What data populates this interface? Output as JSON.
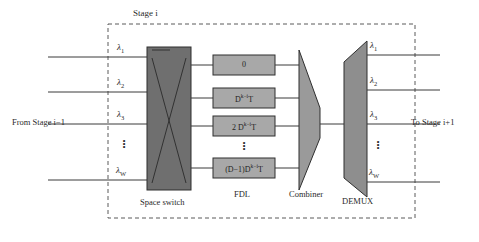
{
  "figure": {
    "type": "block-diagram",
    "title": "Stage i",
    "background": "#ffffff"
  },
  "colors": {
    "space_switch_fill": "#6f6f6f",
    "fdl_fill": "#a8a8a8",
    "combiner_fill": "#9a9a9a",
    "demux_fill": "#8e8e8e",
    "line": "#3a3a3a",
    "dashed_border": "#5a5a5a",
    "text": "#2a2a2a"
  },
  "labels": {
    "stage_title": "Stage i",
    "input_source": "From Stage i−1",
    "output_dest": "To Stage i+1",
    "space_switch": "Space switch",
    "fdl": "FDL",
    "combiner": "Combiner",
    "demux": "DEMUX",
    "vertical_ellipsis": "⋮"
  },
  "input_wavelengths": [
    {
      "label": "λ",
      "sub": "1"
    },
    {
      "label": "λ",
      "sub": "2"
    },
    {
      "label": "λ",
      "sub": "3"
    },
    {
      "label": "λ",
      "sub": "W"
    }
  ],
  "output_wavelengths": [
    {
      "label": "λ",
      "sub": "1"
    },
    {
      "label": "λ",
      "sub": "2"
    },
    {
      "label": "λ",
      "sub": "3"
    },
    {
      "label": "λ",
      "sub": "W"
    }
  ],
  "fdl_boxes": [
    {
      "text": "0",
      "exponent": ""
    },
    {
      "text": "D",
      "exponent": "k−i",
      "suffix": "T"
    },
    {
      "text": "2 D",
      "exponent": "k−i",
      "suffix": "T"
    },
    {
      "text": "(D−1)D",
      "exponent": "k−i",
      "suffix": "T"
    }
  ]
}
